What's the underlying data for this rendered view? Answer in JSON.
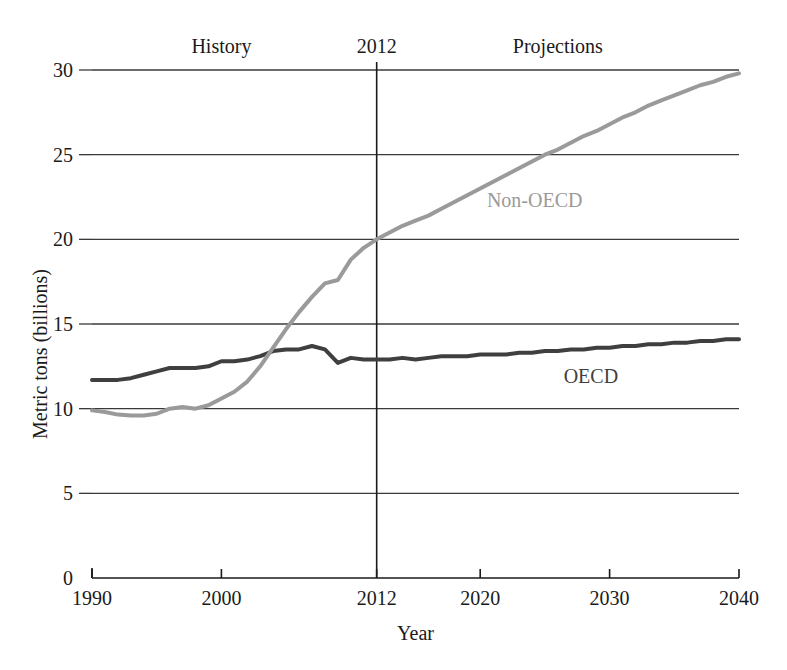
{
  "chart_data": {
    "type": "line",
    "title": "",
    "xlabel": "Year",
    "ylabel": "Metric tons (billions)",
    "xlim": [
      1990,
      2040
    ],
    "ylim": [
      0,
      30
    ],
    "grid": "horizontal",
    "legend_position": "inline-annotations",
    "xticks": [
      1990,
      2000,
      2012,
      2020,
      2030,
      2040
    ],
    "xtick_labels": [
      "1990",
      "2000",
      "2012",
      "2020",
      "2030",
      "2040"
    ],
    "yticks": [
      0,
      5,
      10,
      15,
      20,
      25,
      30
    ],
    "ytick_labels": [
      "0",
      "5",
      "10",
      "15",
      "20",
      "25",
      "30"
    ],
    "annotations": [
      {
        "name": "history-label",
        "text": "History",
        "x": 2000,
        "y": 31.4
      },
      {
        "name": "divider-year-label",
        "text": "2012",
        "x": 2012,
        "y": 31.4
      },
      {
        "name": "projections-label",
        "text": "Projections",
        "x": 2026,
        "y": 31.4
      },
      {
        "name": "non-oecd-series-label",
        "text": "Non-OECD",
        "x": 2025,
        "y": 22.3
      },
      {
        "name": "oecd-series-label",
        "text": "OECD",
        "x": 2029,
        "y": 11.9
      }
    ],
    "divider": {
      "x": 2012,
      "label": "2012"
    },
    "x": [
      1990,
      1991,
      1992,
      1993,
      1994,
      1995,
      1996,
      1997,
      1998,
      1999,
      2000,
      2001,
      2002,
      2003,
      2004,
      2005,
      2006,
      2007,
      2008,
      2009,
      2010,
      2011,
      2012,
      2013,
      2014,
      2015,
      2016,
      2017,
      2018,
      2019,
      2020,
      2021,
      2022,
      2023,
      2024,
      2025,
      2026,
      2027,
      2028,
      2029,
      2030,
      2031,
      2032,
      2033,
      2034,
      2035,
      2036,
      2037,
      2038,
      2039,
      2040
    ],
    "series": [
      {
        "name": "OECD",
        "color": "#3f3f3f",
        "values": [
          11.7,
          11.7,
          11.7,
          11.8,
          12.0,
          12.2,
          12.4,
          12.4,
          12.4,
          12.5,
          12.8,
          12.8,
          12.9,
          13.1,
          13.4,
          13.5,
          13.5,
          13.7,
          13.5,
          12.7,
          13.0,
          12.9,
          12.9,
          12.9,
          13.0,
          12.9,
          13.0,
          13.1,
          13.1,
          13.1,
          13.2,
          13.2,
          13.2,
          13.3,
          13.3,
          13.4,
          13.4,
          13.5,
          13.5,
          13.6,
          13.6,
          13.7,
          13.7,
          13.8,
          13.8,
          13.9,
          13.9,
          14.0,
          14.0,
          14.1,
          14.1
        ]
      },
      {
        "name": "Non-OECD",
        "color": "#9a9a9a",
        "values": [
          9.9,
          9.8,
          9.65,
          9.6,
          9.6,
          9.7,
          10.0,
          10.1,
          10.0,
          10.2,
          10.6,
          11.0,
          11.6,
          12.5,
          13.6,
          14.7,
          15.7,
          16.6,
          17.4,
          17.6,
          18.8,
          19.5,
          20.0,
          20.4,
          20.8,
          21.1,
          21.4,
          21.8,
          22.2,
          22.6,
          23.0,
          23.4,
          23.8,
          24.2,
          24.6,
          25.0,
          25.3,
          25.7,
          26.1,
          26.4,
          26.8,
          27.2,
          27.5,
          27.9,
          28.2,
          28.5,
          28.8,
          29.1,
          29.3,
          29.6,
          29.8
        ]
      }
    ]
  },
  "layout": {
    "plot_left": 92,
    "plot_right": 739,
    "plot_top": 70,
    "plot_bottom": 578
  }
}
